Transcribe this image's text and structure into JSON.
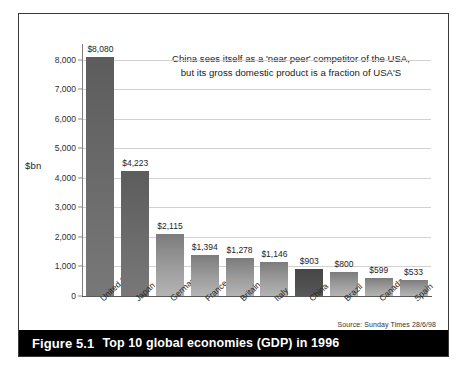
{
  "figure": {
    "caption_number": "Figure 5.1",
    "caption_text": "Top 10 global economies (GDP) in 1996",
    "source_note": "Source: Sunday Times 28/6/98",
    "axis_unit_label": "$bn",
    "annotation_line1": "China sees itself as a 'near peer' competitor of the USA,",
    "annotation_line2": "but its gross domestic product is a fraction of USA'S"
  },
  "colors": {
    "bar_default": "#9d9d9d",
    "bar_dark": "#6d6d6d",
    "bar_accent": "#4f4f4f",
    "caption_bar": "#000000",
    "gridline": "#d2d2d2",
    "frame_border": "#3a3a3a"
  },
  "chart_data": {
    "type": "bar",
    "title": "Top 10 global economies (GDP) in 1996",
    "xlabel": "",
    "ylabel": "$bn",
    "ylim": [
      0,
      8400
    ],
    "grid": true,
    "legend": "none",
    "tick_labels": [
      "0",
      "1,000",
      "2,000",
      "3,000",
      "4,000",
      "5,000",
      "6,000",
      "7,000",
      "8,000"
    ],
    "ticks": [
      0,
      1000,
      2000,
      3000,
      4000,
      5000,
      6000,
      7000,
      8000
    ],
    "categories": [
      "United States",
      "Japan",
      "Germany",
      "France",
      "Britain",
      "Italy",
      "China",
      "Brazil",
      "Canada",
      "Spain"
    ],
    "values": [
      8080,
      4223,
      2115,
      1394,
      1278,
      1146,
      903,
      800,
      599,
      533
    ],
    "value_labels": [
      "$8,080",
      "$4,223",
      "$2,115",
      "$1,394",
      "$1,278",
      "$1,146",
      "$903",
      "$800",
      "$599",
      "$533"
    ],
    "bar_styles": [
      "dark",
      "dark",
      "default",
      "default",
      "default",
      "default",
      "accent",
      "default",
      "default",
      "default"
    ],
    "annotations": [
      "China sees itself as a 'near peer' competitor of the USA,",
      "but its gross domestic product is a fraction of USA'S"
    ],
    "source": "Source: Sunday Times 28/6/98"
  }
}
